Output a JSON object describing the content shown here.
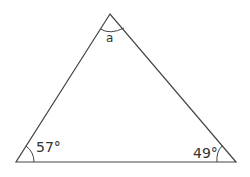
{
  "diagram": {
    "type": "triangle",
    "angles": {
      "top": {
        "label": "a"
      },
      "bottom_left": {
        "label": "57°",
        "value": 57
      },
      "bottom_right": {
        "label": "49°",
        "value": 49
      }
    },
    "colors": {
      "stroke": "#444444",
      "background": "#ffffff"
    }
  }
}
